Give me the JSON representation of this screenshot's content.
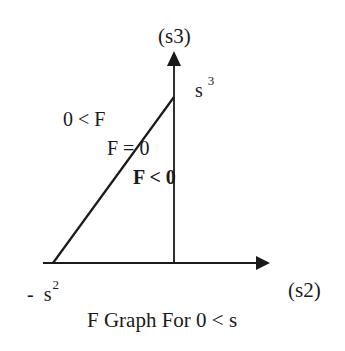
{
  "diagram": {
    "vertical_axis_label": "(s3)",
    "horizontal_axis_label": "(s2)",
    "intercept_top": {
      "base": "s",
      "sup": "3"
    },
    "intercept_left": {
      "prefix": "-",
      "base": "s",
      "sup": "2"
    },
    "region_positive": "0 < F",
    "boundary": "F = 0",
    "region_negative": "F < 0",
    "caption": "F Graph For 0 < s",
    "colors": {
      "line": "#1a1a1a",
      "background": "#ffffff"
    }
  }
}
